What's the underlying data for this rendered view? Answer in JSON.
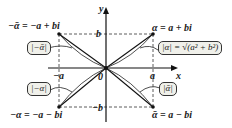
{
  "diagram": {
    "axes": {
      "x_label": "x",
      "y_label": "y",
      "origin_label": "0"
    },
    "ticks": {
      "b": "b",
      "neg_b": "−b",
      "a": "a",
      "neg_a": "−a"
    },
    "points": {
      "alpha": "α = a + bi",
      "neg_alpha_bar": "−ᾱ = −a + bi",
      "neg_alpha": "−α = −a − bi",
      "alpha_bar": "ᾱ = a − bi"
    },
    "boxes": {
      "mod_alpha": "|α| = √(a² + b²)",
      "mod_neg_alpha_bar": "|−ᾱ|",
      "mod_neg_alpha": "|−α|",
      "mod_alpha_bar": "|ᾱ|"
    }
  }
}
